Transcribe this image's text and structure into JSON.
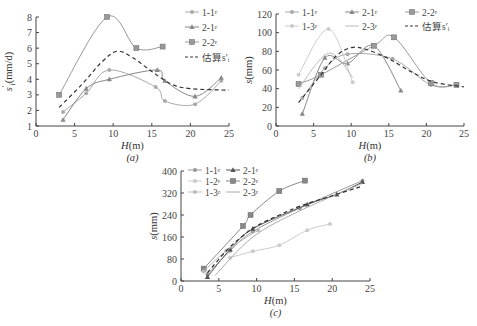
{
  "chart_data": [
    {
      "id": "a",
      "type": "line",
      "caption": "(a)",
      "xlabel": "H(m)",
      "ylabel": "s'_i(mm/d)",
      "xlim": [
        0,
        25
      ],
      "ylim": [
        1,
        8
      ],
      "xticks": [
        0,
        5,
        10,
        15,
        20,
        25
      ],
      "yticks": [
        1,
        2,
        3,
        4,
        5,
        6,
        7,
        8
      ],
      "grid": false,
      "legend_position": "upper right",
      "series": [
        {
          "name": "1-1#",
          "marker": "dot",
          "color": "#aaaaaa",
          "dash": false,
          "x": [
            3.5,
            6.5,
            9.5,
            15.5,
            16.7,
            20.6,
            24.0
          ],
          "y": [
            1.9,
            3.1,
            4.6,
            3.5,
            2.6,
            2.4,
            3.9
          ]
        },
        {
          "name": "2-1#",
          "marker": "triangle",
          "color": "#888888",
          "dash": false,
          "x": [
            3.5,
            6.5,
            9.5,
            15.7,
            16.7,
            20.6,
            24.0
          ],
          "y": [
            1.4,
            3.4,
            4.0,
            4.6,
            3.9,
            2.9,
            4.1
          ]
        },
        {
          "name": "2-2#",
          "marker": "square",
          "color": "#999999",
          "dash": false,
          "x": [
            3.0,
            9.2,
            13.0,
            16.4
          ],
          "y": [
            3.0,
            8.0,
            6.0,
            6.1
          ]
        },
        {
          "name": "估算s'_i",
          "marker": "none",
          "color": "#333333",
          "dash": true,
          "x": [
            3.0,
            6.0,
            8.5,
            10.5,
            12.5,
            15.0,
            17.5,
            20.0,
            25.0
          ],
          "y": [
            2.2,
            3.7,
            5.1,
            5.8,
            5.4,
            4.5,
            3.7,
            3.4,
            3.3
          ]
        }
      ]
    },
    {
      "id": "b",
      "type": "line",
      "caption": "(b)",
      "xlabel": "H(m)",
      "ylabel": "s(mm)",
      "xlim": [
        0,
        25
      ],
      "ylim": [
        0,
        120
      ],
      "xticks": [
        0,
        5,
        10,
        15,
        20,
        25
      ],
      "yticks": [
        0,
        20,
        40,
        60,
        80,
        100,
        120
      ],
      "grid": false,
      "legend_position": "top",
      "series": [
        {
          "name": "1-1#",
          "marker": "dot",
          "color": "#aaaaaa",
          "dash": false,
          "x": [
            3.5,
            6.5,
            9.5,
            15.5,
            20.6,
            24.0
          ],
          "y": [
            30,
            62,
            77,
            72,
            44,
            44
          ]
        },
        {
          "name": "2-1#",
          "marker": "triangle",
          "color": "#888888",
          "dash": false,
          "x": [
            3.5,
            6.5,
            9.5,
            13.0,
            16.6
          ],
          "y": [
            13,
            73,
            67,
            86,
            38
          ]
        },
        {
          "name": "2-2#",
          "marker": "square",
          "color": "#999999",
          "dash": false,
          "x": [
            3.0,
            6.0,
            13.0,
            15.7,
            20.6,
            24.0
          ],
          "y": [
            45,
            55,
            86,
            95,
            46,
            44
          ]
        },
        {
          "name": "1-3#",
          "marker": "dot",
          "color": "#cccccc",
          "dash": false,
          "x": [
            3.0,
            7.0,
            10.2
          ],
          "y": [
            55,
            104,
            47
          ]
        },
        {
          "name": "2-3#",
          "marker": "none",
          "color": "#bbbbbb",
          "dash": false,
          "x": [
            3.0,
            7.0,
            10.2
          ],
          "y": [
            40,
            78,
            52
          ]
        },
        {
          "name": "估算s'_i",
          "marker": "none",
          "color": "#333333",
          "dash": true,
          "x": [
            3.0,
            6.0,
            8.0,
            10.0,
            12.0,
            15.0,
            18.0,
            21.0,
            25.0
          ],
          "y": [
            25,
            55,
            75,
            84,
            82,
            72,
            58,
            47,
            42
          ]
        }
      ]
    },
    {
      "id": "c",
      "type": "line",
      "caption": "(c)",
      "xlabel": "H(m)",
      "ylabel": "s(mm)",
      "xlim": [
        0,
        25
      ],
      "ylim": [
        0,
        400
      ],
      "xticks": [
        0,
        5,
        10,
        15,
        20,
        25
      ],
      "yticks": [
        0,
        80,
        160,
        240,
        320,
        400
      ],
      "grid": false,
      "legend_position": "upper left",
      "series": [
        {
          "name": "1-1#",
          "marker": "dot",
          "color": "#999999",
          "dash": false,
          "x": [
            3.5,
            6.5,
            9.5,
            15.7,
            24.0
          ],
          "y": [
            25,
            110,
            180,
            265,
            365
          ]
        },
        {
          "name": "2-1#",
          "marker": "triangle",
          "color": "#555555",
          "dash": false,
          "x": [
            3.5,
            6.5,
            9.5,
            16.7,
            20.6,
            24.0
          ],
          "y": [
            15,
            115,
            190,
            278,
            315,
            360
          ]
        },
        {
          "name": "1-2#",
          "marker": "dot",
          "color": "#cccccc",
          "dash": false,
          "x": [
            6.5,
            9.5,
            13.0,
            16.7,
            19.7
          ],
          "y": [
            85,
            108,
            130,
            185,
            207
          ]
        },
        {
          "name": "2-2#",
          "marker": "square",
          "color": "#888888",
          "dash": false,
          "x": [
            3.0,
            8.2,
            9.2,
            13.0,
            16.4
          ],
          "y": [
            45,
            200,
            240,
            327,
            365
          ]
        },
        {
          "name": "1-3#",
          "marker": "dot",
          "color": "#bbbbbb",
          "dash": false,
          "x": [
            3.0,
            6.0,
            10.2
          ],
          "y": [
            35,
            110,
            185
          ]
        },
        {
          "name": "2-3#",
          "marker": "none",
          "color": "#aaaaaa",
          "dash": false,
          "x": [
            4.5,
            9.5,
            15.7,
            24.0
          ],
          "y": [
            20,
            160,
            255,
            355
          ]
        },
        {
          "name": "fit",
          "marker": "none",
          "color": "#333333",
          "dash": true,
          "x": [
            3.5,
            6.0,
            8.0,
            10.0,
            13.0,
            16.0,
            20.0,
            24.0
          ],
          "y": [
            30,
            110,
            160,
            200,
            240,
            275,
            310,
            345
          ]
        }
      ]
    }
  ],
  "labels": {
    "a": {
      "caption": "(a)",
      "xlabel_main": "H",
      "xlabel_unit": "(m)",
      "ylabel_main": "s",
      "ylabel_sup": "'",
      "ylabel_sub": "i",
      "ylabel_unit": "(mm/d)"
    },
    "b": {
      "caption": "(b)",
      "xlabel_main": "H",
      "xlabel_unit": "(m)",
      "ylabel_main": "s",
      "ylabel_unit": "(mm)"
    },
    "c": {
      "caption": "(c)",
      "xlabel_main": "H",
      "xlabel_unit": "(m)",
      "ylabel_main": "s",
      "ylabel_unit": "(mm)"
    }
  }
}
